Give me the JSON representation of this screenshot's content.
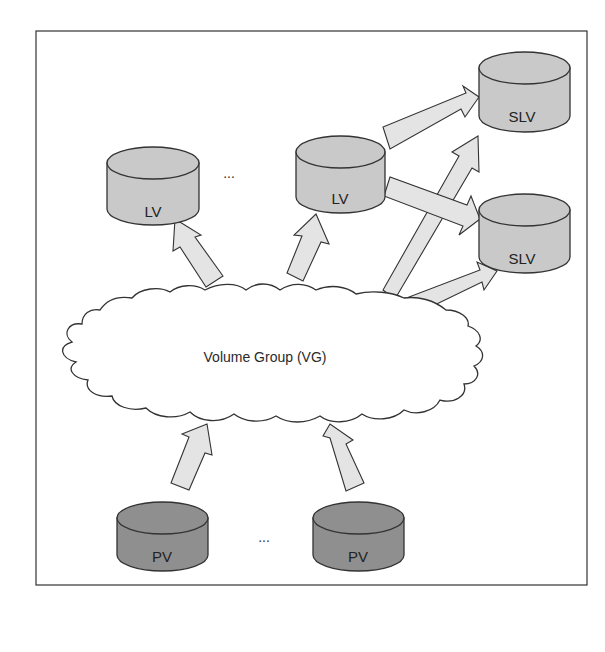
{
  "diagram": {
    "colors": {
      "frame": "#333333",
      "lv_fill": "#c9c9c9",
      "pv_fill": "#8f8f8f",
      "arrow_fill": "#e4e4e4",
      "cloud_fill": "#ffffff"
    },
    "cloud": {
      "label": "Volume Group (VG)"
    },
    "nodes": {
      "lv1": {
        "label": "LV"
      },
      "lv2": {
        "label": "LV"
      },
      "slv1": {
        "label": "SLV"
      },
      "slv2": {
        "label": "SLV"
      },
      "pv1": {
        "label": "PV"
      },
      "pv2": {
        "label": "PV"
      }
    },
    "ellipsis_top": "...",
    "ellipsis_bottom": "...",
    "edges": [
      {
        "from": "pv1",
        "to": "vg"
      },
      {
        "from": "pv2",
        "to": "vg"
      },
      {
        "from": "vg",
        "to": "lv1"
      },
      {
        "from": "vg",
        "to": "lv2"
      },
      {
        "from": "vg",
        "to": "slv1"
      },
      {
        "from": "vg",
        "to": "slv2"
      },
      {
        "from": "lv2",
        "to": "slv1"
      },
      {
        "from": "lv2",
        "to": "slv2"
      }
    ]
  }
}
